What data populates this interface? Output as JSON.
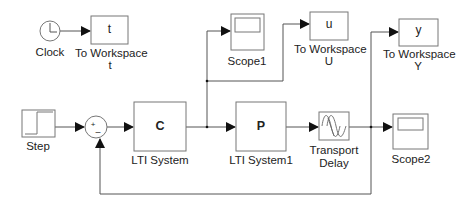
{
  "diagram": {
    "type": "simulink-block-diagram",
    "colors": {
      "line": "#555555",
      "block_border": "#777777",
      "background": "#ffffff",
      "text": "#222222"
    },
    "blocks": [
      {
        "id": "clock",
        "kind": "Clock",
        "label": "Clock",
        "icon": "clock-icon"
      },
      {
        "id": "ws_t",
        "kind": "ToWorkspace",
        "content": "t",
        "label_line1": "To Workspace",
        "label_line2": "t"
      },
      {
        "id": "step",
        "kind": "Step",
        "label": "Step",
        "icon": "step-icon"
      },
      {
        "id": "sum",
        "kind": "Sum",
        "signs": [
          "+",
          "–"
        ]
      },
      {
        "id": "lti_c",
        "kind": "LTI System",
        "content": "C",
        "label": "LTI System"
      },
      {
        "id": "lti_p",
        "kind": "LTI System",
        "content": "P",
        "label": "LTI System1"
      },
      {
        "id": "delay",
        "kind": "Transport Delay",
        "label_line1": "Transport",
        "label_line2": "Delay",
        "icon": "transport-delay-icon"
      },
      {
        "id": "scope1",
        "kind": "Scope",
        "label": "Scope1",
        "icon": "scope-icon"
      },
      {
        "id": "ws_u",
        "kind": "ToWorkspace",
        "content": "u",
        "label_line1": "To Workspace",
        "label_line2": "U"
      },
      {
        "id": "scope2",
        "kind": "Scope",
        "label": "Scope2",
        "icon": "scope-icon"
      },
      {
        "id": "ws_y",
        "kind": "ToWorkspace",
        "content": "y",
        "label_line1": "To Workspace",
        "label_line2": "Y"
      }
    ],
    "connections": [
      {
        "from": "clock",
        "to": "ws_t"
      },
      {
        "from": "step",
        "to": "sum",
        "port": "+"
      },
      {
        "from": "sum",
        "to": "lti_c"
      },
      {
        "from": "lti_c",
        "to": "lti_p"
      },
      {
        "from": "lti_c",
        "to": "scope1"
      },
      {
        "from": "lti_c",
        "to": "ws_u"
      },
      {
        "from": "lti_p",
        "to": "delay"
      },
      {
        "from": "delay",
        "to": "scope2"
      },
      {
        "from": "delay",
        "to": "ws_y"
      },
      {
        "from": "delay",
        "to": "sum",
        "port": "-"
      }
    ]
  }
}
